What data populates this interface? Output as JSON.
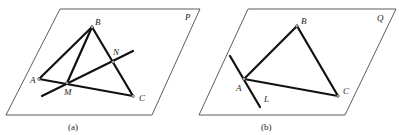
{
  "figures": [
    {
      "id": "a",
      "caption": "(a)",
      "plane_label": "P",
      "points": {
        "A": "A",
        "B": "B",
        "C": "C",
        "M": "M",
        "N": "N"
      },
      "description": "Triangle ABC in plane P with median BM from B to M on AC, and a line through M and N (N on BC)"
    },
    {
      "id": "b",
      "caption": "(b)",
      "plane_label": "Q",
      "points": {
        "A": "A",
        "B": "B",
        "C": "C"
      },
      "line_label": "L",
      "description": "Triangle ABC in plane Q with line L passing through vertex A"
    }
  ]
}
